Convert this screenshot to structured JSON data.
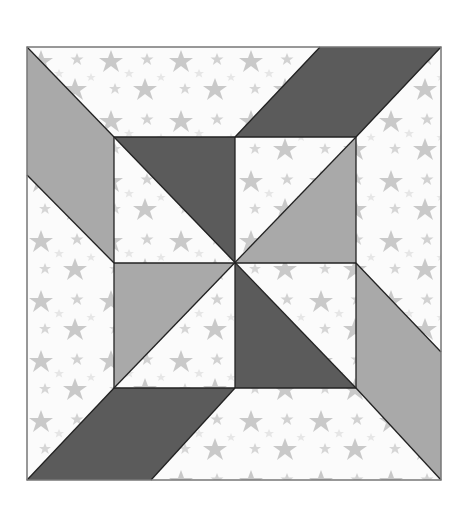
{
  "figure": {
    "canvas": {
      "width": 473,
      "height": 505
    },
    "block": {
      "x": 27,
      "y": 47,
      "width": 414,
      "height": 433
    },
    "inner_square": {
      "x": 114,
      "y": 137,
      "width": 242,
      "height": 251
    },
    "center": {
      "x": 235,
      "y": 263
    }
  },
  "colors": {
    "background": "#ffffff",
    "star_print_base": "#fbfbfb",
    "star": "#c9c9c9",
    "star_faint": "#e6e6e6",
    "dark_fabric": "#5b5b5b",
    "medium_fabric": "#a9a9a9",
    "seam_line": "#222222",
    "border": "#777777"
  },
  "pieces": [
    {
      "name": "left-parallelogram",
      "fabric": "medium",
      "points": "27,47 114,137 114,263 27,175"
    },
    {
      "name": "top-parallelogram",
      "fabric": "dark",
      "points": "235,137 320,47 441,47 356,137"
    },
    {
      "name": "right-parallelogram",
      "fabric": "medium",
      "points": "356,263 441,352 441,480 356,388"
    },
    {
      "name": "bottom-parallelogram",
      "fabric": "dark",
      "points": "27,480 114,388 235,388 151,480"
    },
    {
      "name": "center-top-left-triangle",
      "fabric": "dark",
      "points": "114,137 235,137 235,263"
    },
    {
      "name": "center-top-right-triangle",
      "fabric": "medium",
      "points": "356,137 356,263 235,263"
    },
    {
      "name": "center-bottom-left-triangle",
      "fabric": "medium",
      "points": "114,263 235,263 114,388"
    },
    {
      "name": "center-bottom-right-triangle",
      "fabric": "dark",
      "points": "235,263 235,388 356,388"
    }
  ],
  "seams": [
    "114,137 356,137",
    "114,388 356,388",
    "114,137 114,388",
    "356,137 356,388",
    "235,137 235,388",
    "114,263 356,263",
    "114,137 356,388",
    "356,137 114,388",
    "27,47 114,137",
    "27,175 114,263",
    "320,47 235,137",
    "441,47 356,137",
    "356,263 441,352",
    "356,388 441,480",
    "114,388 27,480",
    "235,388 151,480"
  ]
}
